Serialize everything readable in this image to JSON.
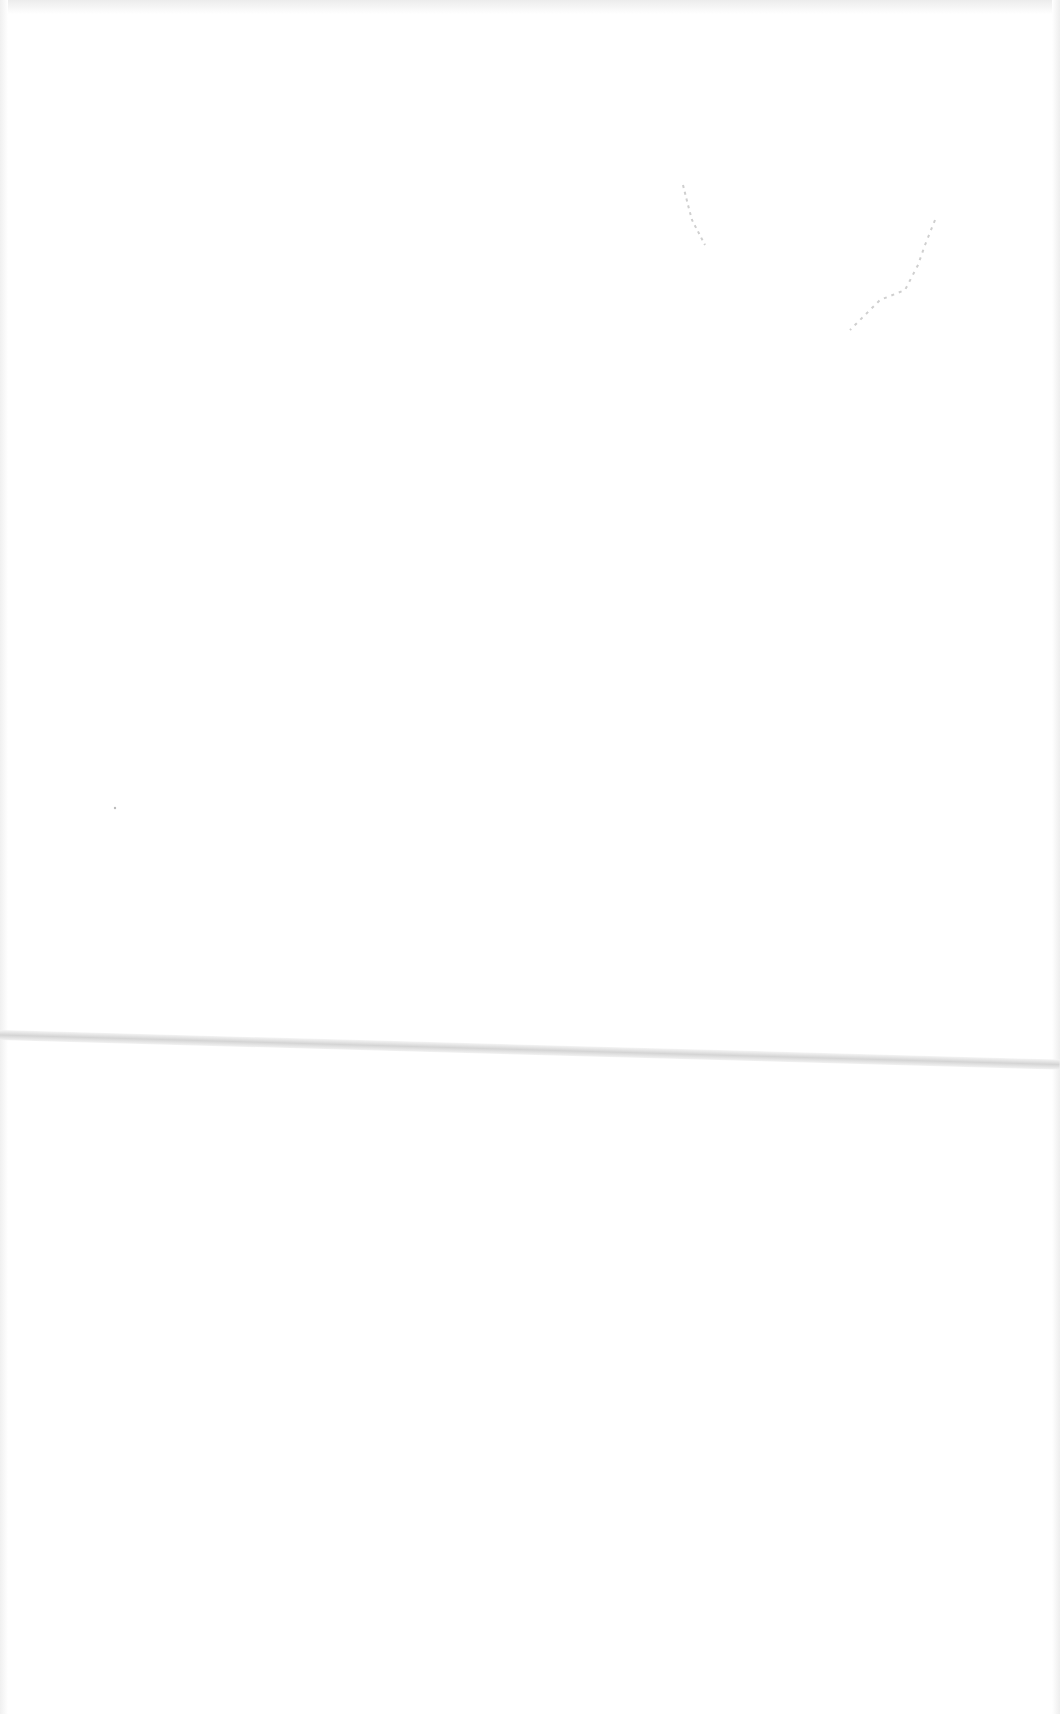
{
  "page": {
    "fold_line": {
      "y_start": 1028,
      "y_end": 1058,
      "color": "#d4d4d4"
    },
    "marks": [
      {
        "type": "faint-stroke",
        "color": "#c8c8c8"
      }
    ]
  }
}
